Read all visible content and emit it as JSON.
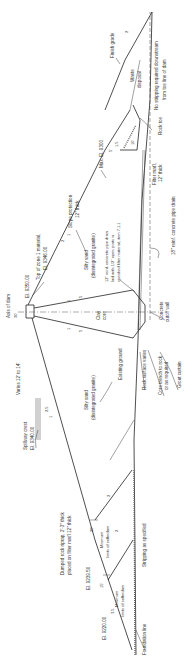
{
  "figure": {
    "orientation": "rotated-90-ccw",
    "colors": {
      "line": "#222222",
      "text": "#333333",
      "background": "#ffffff"
    }
  },
  "labels": {
    "axis_of_dam": "Axis of dam",
    "crest_width": "30'",
    "crest_varies": "Varies 12' to 14'",
    "crest_elevation": "El. 9350.00",
    "top_zone1": "Top of zone 1 material,",
    "top_zone1_el": "El. 9346.00",
    "spillway_crest": "Spillway crest",
    "spillway_crest_el": "El. 9340.00",
    "slope_protection": "Slope protection",
    "slope_protection_thick": "12\" thick",
    "silty_sand_down": "Silty sand",
    "silty_sand_down_note": "(disintegrated granite)",
    "silty_sand_up": "Silty sand",
    "silty_sand_up_note": "(disintegrated granite)",
    "clay_core": "Clay",
    "clay_core_2": "core",
    "pipe_drain_12": "12\" reinf. concrete pipe drain",
    "pipe_drain_12_b": "laid with 1/2\" open joints in",
    "pipe_drain_12_c": "specified filter material, item 7.1.1",
    "pipe_drain_18": "18\" reinf. concrete pipe drain",
    "concrete_cutoff": "Concrete",
    "concrete_cutoff_2": "cutoff wall",
    "grout_curtain": "Grout curtain",
    "core_trench": "Core trench to rock",
    "core_trench_2": "or as required",
    "rock_surface": "Rock surface varies",
    "existing_ground": "Existing ground",
    "dumped_riprap": "Dumped rock riprap, 2'-3\" thick",
    "dumped_riprap_2": "placed on filter mat'l 12\" thick",
    "el_9239": "El. 9239.50",
    "el_9220": "El. 9220.00",
    "min_cofferdam_1": "Minimum",
    "min_cofferdam_1b": "limits of cofferdam",
    "min_cofferdam_2": "Minimum",
    "min_cofferdam_2b": "limits of cofferdam",
    "berm_20": "20'",
    "berm_15": "15'",
    "stripping": "Stripping as specified",
    "foundation_line": "Foundation line",
    "max_el": "Max. El. 9300",
    "filter_mat": "Filter mat'l,",
    "filter_mat_2": "12\" thick",
    "rock_toe": "Rock toe",
    "toe_top": "10'",
    "toe_5": "5'",
    "waste_disposal": "Waste",
    "waste_disposal_2": "disposal",
    "finish_grade": "Finish grade",
    "no_stripping": "No stripping required downstream",
    "no_stripping_2": "from toe line of dam"
  },
  "slopes": {
    "upstream_core": {
      "run": "5",
      "rise": "1"
    },
    "downstream_core": {
      "run": "5",
      "rise": "1"
    },
    "downstream_shell": {
      "run": "2",
      "rise": "1"
    },
    "upstream_shell": {
      "run": "2.5",
      "rise": "1"
    },
    "upstream_berm": {
      "run": "3.5",
      "rise": "1"
    },
    "cofferdam_1": {
      "run": "2",
      "rise": "1"
    },
    "cofferdam_2": {
      "run": "2",
      "rise": "1"
    },
    "waste": {
      "run": "2",
      "rise": "1"
    },
    "toe": {
      "run": "1.5",
      "rise": "1"
    }
  }
}
